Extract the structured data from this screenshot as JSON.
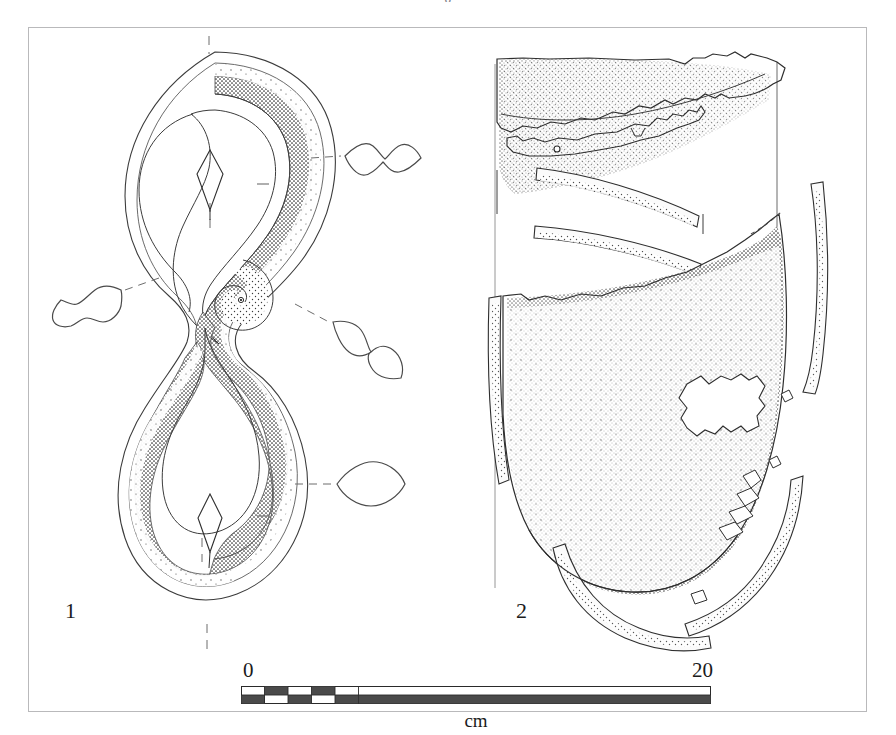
{
  "plate": {
    "top_partial_text": "g",
    "background_color": "#ffffff",
    "frame_color": "#b9b9bb",
    "ink_color": "#1c1c1c",
    "stipple_color": "#3a3a3a"
  },
  "figures": [
    {
      "number": "1",
      "label": "1",
      "caption_position": "bottom-left",
      "object_type": "figure-eight-shaped-metal-object",
      "description": "Plan view of a double-looped figure-eight object with stippled shading and four cross-section profiles on dashed leader lines",
      "cross_sections": [
        {
          "id": "profile-upper-right",
          "shape": "double-lozenge-horizontal"
        },
        {
          "id": "profile-left",
          "shape": "double-lozenge-oblique"
        },
        {
          "id": "profile-middle-right",
          "shape": "double-lozenge-diagonal"
        },
        {
          "id": "profile-lower-right",
          "shape": "single-lens"
        }
      ]
    },
    {
      "number": "2",
      "label": "2",
      "caption_position": "bottom-left",
      "object_type": "reconstructed-vessel-sherds",
      "description": "Profile/elevation of a reconstructed vessel with fragmentary rim, body bands and base sherds, heavy stipple shading on right side"
    }
  ],
  "scale_bar": {
    "min_label": "0",
    "max_label": "20",
    "unit": "cm",
    "total_units": 20,
    "minor_segment_units": 1,
    "minor_segment_count": 5,
    "major_block_units": 15,
    "dark_color": "#4a4a4a",
    "light_color": "#ffffff",
    "outline_color": "#2a2a2a"
  }
}
